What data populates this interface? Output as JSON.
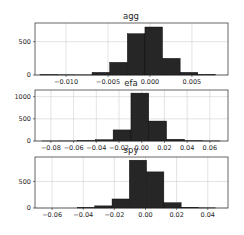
{
  "chart_data": [
    {
      "type": "bar",
      "title": "agg",
      "xlabel": "",
      "ylabel": "",
      "grid": true,
      "xlim": [
        -0.0137,
        0.0093
      ],
      "ylim": [
        0,
        780
      ],
      "xticks": [
        -0.01,
        -0.005,
        0.0,
        0.005
      ],
      "xtick_labels": [
        "−0.010",
        "−0.005",
        "0.000",
        "0.005"
      ],
      "yticks": [
        0,
        500
      ],
      "ytick_labels": [
        "0",
        "500"
      ],
      "bin_edges": [
        -0.0131,
        -0.011,
        -0.009,
        -0.0069,
        -0.0048,
        -0.0027,
        -0.0006,
        0.0015,
        0.0036,
        0.0057,
        0.0078
      ],
      "counts": [
        5,
        3,
        2,
        40,
        190,
        620,
        720,
        250,
        40,
        8
      ]
    },
    {
      "type": "bar",
      "title": "efa",
      "xlabel": "",
      "ylabel": "",
      "grid": true,
      "xlim": [
        -0.094,
        0.076
      ],
      "ylim": [
        0,
        1150
      ],
      "xticks": [
        -0.08,
        -0.06,
        -0.04,
        -0.02,
        0.0,
        0.02,
        0.04,
        0.06
      ],
      "xtick_labels": [
        "−0.08",
        "−0.06",
        "−0.04",
        "−0.02",
        "0.00",
        "0.02",
        "0.04",
        "0.06"
      ],
      "yticks": [
        0,
        500,
        1000
      ],
      "ytick_labels": [
        "0",
        "500",
        "1000"
      ],
      "bin_edges": [
        -0.088,
        -0.0723,
        -0.0566,
        -0.0409,
        -0.0252,
        -0.0095,
        0.0062,
        0.0219,
        0.0376,
        0.0533,
        0.069
      ],
      "counts": [
        1,
        2,
        10,
        30,
        250,
        1080,
        450,
        40,
        5,
        2
      ]
    },
    {
      "type": "bar",
      "title": "spy",
      "xlabel": "",
      "ylabel": "",
      "grid": true,
      "xlim": [
        -0.071,
        0.053
      ],
      "ylim": [
        0,
        960
      ],
      "xticks": [
        -0.06,
        -0.04,
        -0.02,
        0.0,
        0.02,
        0.04
      ],
      "xtick_labels": [
        "−0.06",
        "−0.04",
        "−0.02",
        "0.00",
        "0.02",
        "0.04"
      ],
      "yticks": [
        0,
        500
      ],
      "ytick_labels": [
        "0",
        "500"
      ],
      "bin_edges": [
        -0.0437,
        -0.0326,
        -0.0215,
        -0.0104,
        0.0007,
        0.0118,
        0.0229,
        0.034,
        0.0451
      ],
      "counts": [
        10,
        40,
        170,
        900,
        680,
        100,
        15,
        3
      ]
    }
  ],
  "layout": {
    "axes": [
      {
        "left": 35,
        "right": 228,
        "top": 23,
        "bottom": 75
      },
      {
        "left": 35,
        "right": 228,
        "top": 90,
        "bottom": 141
      },
      {
        "left": 35,
        "right": 228,
        "top": 157,
        "bottom": 208
      }
    ]
  }
}
